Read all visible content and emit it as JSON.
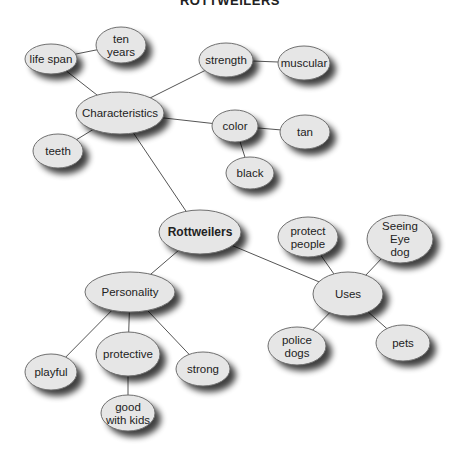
{
  "title": "ROTTWEILERS",
  "colors": {
    "node_fill": "#e6e6e6",
    "node_stroke": "#6f6f6f",
    "edge": "#555555",
    "shadow": "#000000"
  },
  "nodes": [
    {
      "id": "rottweilers",
      "lines": [
        "Rottweilers"
      ],
      "cx": 200,
      "cy": 232,
      "rx": 41,
      "ry": 22,
      "bold": true
    },
    {
      "id": "characteristics",
      "lines": [
        "Characteristics"
      ],
      "cx": 120,
      "cy": 113,
      "rx": 44,
      "ry": 21
    },
    {
      "id": "life-span",
      "lines": [
        "life span"
      ],
      "cx": 51,
      "cy": 59,
      "rx": 26,
      "ry": 15
    },
    {
      "id": "ten-years",
      "lines": [
        "ten",
        "years"
      ],
      "cx": 121,
      "cy": 45,
      "rx": 25,
      "ry": 18
    },
    {
      "id": "strength",
      "lines": [
        "strength"
      ],
      "cx": 226,
      "cy": 60,
      "rx": 27,
      "ry": 17
    },
    {
      "id": "muscular",
      "lines": [
        "muscular"
      ],
      "cx": 304,
      "cy": 63,
      "rx": 26,
      "ry": 17
    },
    {
      "id": "color",
      "lines": [
        "color"
      ],
      "cx": 235,
      "cy": 126,
      "rx": 23,
      "ry": 16
    },
    {
      "id": "tan",
      "lines": [
        "tan"
      ],
      "cx": 305,
      "cy": 132,
      "rx": 25,
      "ry": 17
    },
    {
      "id": "black",
      "lines": [
        "black"
      ],
      "cx": 250,
      "cy": 173,
      "rx": 24,
      "ry": 16
    },
    {
      "id": "teeth",
      "lines": [
        "teeth"
      ],
      "cx": 58,
      "cy": 151,
      "rx": 25,
      "ry": 17
    },
    {
      "id": "uses",
      "lines": [
        "Uses"
      ],
      "cx": 348,
      "cy": 294,
      "rx": 35,
      "ry": 22
    },
    {
      "id": "protect-people",
      "lines": [
        "protect",
        "people"
      ],
      "cx": 308,
      "cy": 237,
      "rx": 30,
      "ry": 20
    },
    {
      "id": "seeing-eye-dog",
      "lines": [
        "Seeing",
        "Eye",
        "dog"
      ],
      "cx": 400,
      "cy": 239,
      "rx": 33,
      "ry": 24
    },
    {
      "id": "police-dogs",
      "lines": [
        "police",
        "dogs"
      ],
      "cx": 297,
      "cy": 346,
      "rx": 29,
      "ry": 19
    },
    {
      "id": "pets",
      "lines": [
        "pets"
      ],
      "cx": 403,
      "cy": 343,
      "rx": 27,
      "ry": 18
    },
    {
      "id": "personality",
      "lines": [
        "Personality"
      ],
      "cx": 130,
      "cy": 292,
      "rx": 45,
      "ry": 20
    },
    {
      "id": "playful",
      "lines": [
        "playful"
      ],
      "cx": 51,
      "cy": 372,
      "rx": 26,
      "ry": 18
    },
    {
      "id": "protective",
      "lines": [
        "protective"
      ],
      "cx": 128,
      "cy": 354,
      "rx": 32,
      "ry": 22
    },
    {
      "id": "strong",
      "lines": [
        "strong"
      ],
      "cx": 203,
      "cy": 369,
      "rx": 27,
      "ry": 17
    },
    {
      "id": "good-with-kids",
      "lines": [
        "good",
        "with kids"
      ],
      "cx": 128,
      "cy": 413,
      "rx": 27,
      "ry": 18
    }
  ],
  "edges": [
    [
      "rottweilers",
      "characteristics"
    ],
    [
      "rottweilers",
      "personality"
    ],
    [
      "rottweilers",
      "uses"
    ],
    [
      "characteristics",
      "life-span"
    ],
    [
      "life-span",
      "ten-years"
    ],
    [
      "characteristics",
      "strength"
    ],
    [
      "strength",
      "muscular"
    ],
    [
      "characteristics",
      "color"
    ],
    [
      "color",
      "tan"
    ],
    [
      "color",
      "black"
    ],
    [
      "characteristics",
      "teeth"
    ],
    [
      "uses",
      "protect-people"
    ],
    [
      "uses",
      "seeing-eye-dog"
    ],
    [
      "uses",
      "police-dogs"
    ],
    [
      "uses",
      "pets"
    ],
    [
      "personality",
      "playful"
    ],
    [
      "personality",
      "protective"
    ],
    [
      "personality",
      "strong"
    ],
    [
      "protective",
      "good-with-kids"
    ]
  ]
}
